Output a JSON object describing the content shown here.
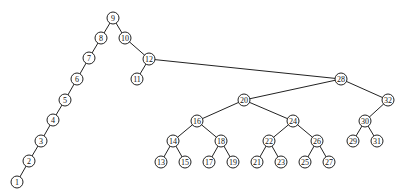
{
  "diagram": {
    "type": "binary-tree",
    "node_radius": 6,
    "nodes": [
      {
        "id": "9",
        "label": "9",
        "x": 113,
        "y": 18
      },
      {
        "id": "8",
        "label": "8",
        "x": 101,
        "y": 38
      },
      {
        "id": "10",
        "label": "10",
        "x": 125,
        "y": 38
      },
      {
        "id": "7",
        "label": "7",
        "x": 89,
        "y": 58
      },
      {
        "id": "12",
        "label": "12",
        "x": 149,
        "y": 59
      },
      {
        "id": "6",
        "label": "6",
        "x": 77,
        "y": 79
      },
      {
        "id": "11",
        "label": "11",
        "x": 137,
        "y": 79
      },
      {
        "id": "5",
        "label": "5",
        "x": 65,
        "y": 100
      },
      {
        "id": "4",
        "label": "4",
        "x": 53,
        "y": 120
      },
      {
        "id": "3",
        "label": "3",
        "x": 41,
        "y": 141
      },
      {
        "id": "2",
        "label": "2",
        "x": 29,
        "y": 161
      },
      {
        "id": "1",
        "label": "1",
        "x": 17,
        "y": 182
      },
      {
        "id": "28",
        "label": "28",
        "x": 341,
        "y": 79
      },
      {
        "id": "20",
        "label": "20",
        "x": 244,
        "y": 100
      },
      {
        "id": "32",
        "label": "32",
        "x": 388,
        "y": 100
      },
      {
        "id": "16",
        "label": "16",
        "x": 197,
        "y": 121
      },
      {
        "id": "24",
        "label": "24",
        "x": 293,
        "y": 121
      },
      {
        "id": "30",
        "label": "30",
        "x": 365,
        "y": 121
      },
      {
        "id": "14",
        "label": "14",
        "x": 173,
        "y": 141
      },
      {
        "id": "18",
        "label": "18",
        "x": 221,
        "y": 141
      },
      {
        "id": "22",
        "label": "22",
        "x": 269,
        "y": 141
      },
      {
        "id": "26",
        "label": "26",
        "x": 317,
        "y": 141
      },
      {
        "id": "29",
        "label": "29",
        "x": 353,
        "y": 141
      },
      {
        "id": "31",
        "label": "31",
        "x": 377,
        "y": 141
      },
      {
        "id": "13",
        "label": "13",
        "x": 161,
        "y": 162
      },
      {
        "id": "15",
        "label": "15",
        "x": 185,
        "y": 162
      },
      {
        "id": "17",
        "label": "17",
        "x": 209,
        "y": 162
      },
      {
        "id": "19",
        "label": "19",
        "x": 233,
        "y": 162
      },
      {
        "id": "21",
        "label": "21",
        "x": 257,
        "y": 162
      },
      {
        "id": "23",
        "label": "23",
        "x": 281,
        "y": 162
      },
      {
        "id": "25",
        "label": "25",
        "x": 305,
        "y": 162
      },
      {
        "id": "27",
        "label": "27",
        "x": 329,
        "y": 162
      }
    ],
    "edges": [
      [
        "9",
        "8"
      ],
      [
        "9",
        "10"
      ],
      [
        "8",
        "7"
      ],
      [
        "7",
        "6"
      ],
      [
        "6",
        "5"
      ],
      [
        "5",
        "4"
      ],
      [
        "4",
        "3"
      ],
      [
        "3",
        "2"
      ],
      [
        "2",
        "1"
      ],
      [
        "10",
        "12"
      ],
      [
        "12",
        "11"
      ],
      [
        "12",
        "28"
      ],
      [
        "28",
        "20"
      ],
      [
        "28",
        "32"
      ],
      [
        "20",
        "16"
      ],
      [
        "20",
        "24"
      ],
      [
        "16",
        "14"
      ],
      [
        "16",
        "18"
      ],
      [
        "14",
        "13"
      ],
      [
        "14",
        "15"
      ],
      [
        "18",
        "17"
      ],
      [
        "18",
        "19"
      ],
      [
        "24",
        "22"
      ],
      [
        "24",
        "26"
      ],
      [
        "22",
        "21"
      ],
      [
        "22",
        "23"
      ],
      [
        "26",
        "25"
      ],
      [
        "26",
        "27"
      ],
      [
        "32",
        "30"
      ],
      [
        "30",
        "29"
      ],
      [
        "30",
        "31"
      ]
    ]
  }
}
